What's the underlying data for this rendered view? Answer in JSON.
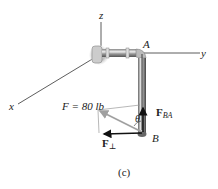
{
  "axes": {
    "x_label": "x",
    "y_label": "y",
    "z_label": "z"
  },
  "points": {
    "A": "A",
    "B": "B"
  },
  "force": {
    "label": "F = 80 lb",
    "symbol": "F",
    "magnitude": "80 lb"
  },
  "components": {
    "parallel_symbol": "F",
    "parallel_sub": "BA",
    "perpendicular_symbol": "F",
    "perpendicular_sub": "⊥"
  },
  "angle_label": "θ",
  "caption": "(c)",
  "colors": {
    "axis": "#333333",
    "pipe_dark": "#555555",
    "pipe_light": "#d8d8d8",
    "force_gray": "#a0a0a0",
    "vector_black": "#111111"
  }
}
